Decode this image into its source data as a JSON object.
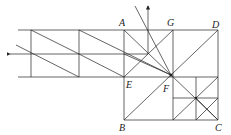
{
  "diagram": {
    "type": "geometry-ray-diagram",
    "labels": {
      "A": "A",
      "G": "G",
      "D": "D",
      "E": "E",
      "F": "F",
      "B": "B",
      "C": "C"
    },
    "colors": {
      "line": "#222222",
      "background": "#ffffff"
    }
  }
}
